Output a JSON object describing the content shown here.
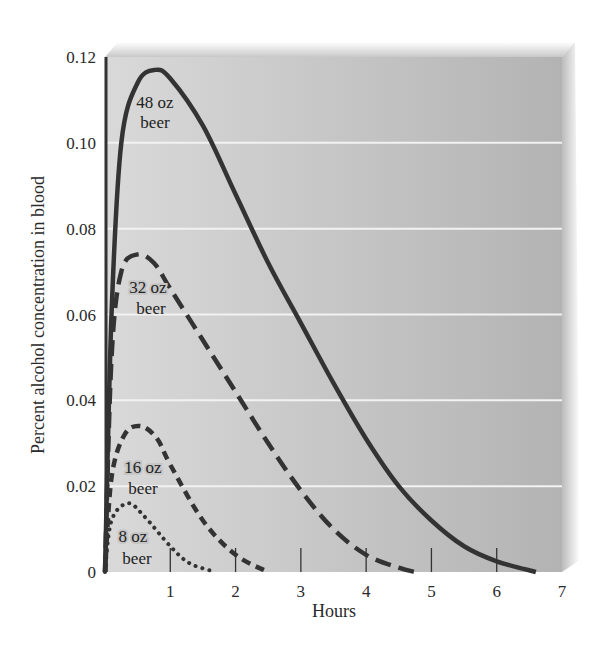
{
  "chart_data": {
    "type": "line",
    "title": "",
    "xlabel": "Hours",
    "ylabel": "Percent alcohol concentration in blood",
    "xlim": [
      0,
      7
    ],
    "ylim": [
      0,
      0.12
    ],
    "x_ticks": [
      "1",
      "2",
      "3",
      "4",
      "5",
      "6",
      "7"
    ],
    "y_ticks": [
      "0",
      "0.02",
      "0.04",
      "0.06",
      "0.08",
      "0.10",
      "0.12"
    ],
    "grid": true,
    "legend_position": "inline labels near peaks",
    "series": [
      {
        "name": "48 oz beer",
        "label_lines": [
          "48 oz",
          "beer"
        ],
        "style": "solid",
        "peak": {
          "x": 0.77,
          "y": 0.117
        },
        "points": [
          [
            0,
            0
          ],
          [
            0.1,
            0.06
          ],
          [
            0.25,
            0.1
          ],
          [
            0.5,
            0.114
          ],
          [
            0.77,
            0.117
          ],
          [
            1.0,
            0.115
          ],
          [
            1.5,
            0.104
          ],
          [
            2.0,
            0.088
          ],
          [
            2.5,
            0.072
          ],
          [
            3.0,
            0.058
          ],
          [
            3.5,
            0.044
          ],
          [
            4.0,
            0.031
          ],
          [
            4.5,
            0.02
          ],
          [
            5.0,
            0.012
          ],
          [
            5.5,
            0.006
          ],
          [
            6.0,
            0.0025
          ],
          [
            6.6,
            0
          ]
        ]
      },
      {
        "name": "32 oz beer",
        "label_lines": [
          "32 oz",
          "beer"
        ],
        "style": "long-dash",
        "peak": {
          "x": 0.5,
          "y": 0.074
        },
        "points": [
          [
            0,
            0
          ],
          [
            0.1,
            0.05
          ],
          [
            0.25,
            0.07
          ],
          [
            0.5,
            0.074
          ],
          [
            0.75,
            0.072
          ],
          [
            1.0,
            0.066
          ],
          [
            1.5,
            0.054
          ],
          [
            2.0,
            0.042
          ],
          [
            2.5,
            0.03
          ],
          [
            3.0,
            0.019
          ],
          [
            3.5,
            0.01
          ],
          [
            4.0,
            0.004
          ],
          [
            4.5,
            0.001
          ],
          [
            4.75,
            0
          ]
        ]
      },
      {
        "name": "16 oz beer",
        "label_lines": [
          "16 oz",
          "beer"
        ],
        "style": "short-dash",
        "peak": {
          "x": 0.55,
          "y": 0.034
        },
        "points": [
          [
            0,
            0
          ],
          [
            0.1,
            0.022
          ],
          [
            0.3,
            0.032
          ],
          [
            0.55,
            0.034
          ],
          [
            0.8,
            0.031
          ],
          [
            1.0,
            0.025
          ],
          [
            1.5,
            0.012
          ],
          [
            2.0,
            0.004
          ],
          [
            2.5,
            0
          ]
        ]
      },
      {
        "name": "8 oz beer",
        "label_lines": [
          "8 oz",
          "beer"
        ],
        "style": "dotted",
        "peak": {
          "x": 0.35,
          "y": 0.016
        },
        "points": [
          [
            0,
            0
          ],
          [
            0.1,
            0.012
          ],
          [
            0.35,
            0.016
          ],
          [
            0.6,
            0.013
          ],
          [
            1.0,
            0.006
          ],
          [
            1.3,
            0.002
          ],
          [
            1.7,
            0
          ]
        ]
      }
    ]
  },
  "colors": {
    "panel": "#bdbdbd",
    "panel_top": "#cfcfcf",
    "gridline": "#f2f2f2",
    "curve": "#333333",
    "text": "#2a2a2a"
  }
}
